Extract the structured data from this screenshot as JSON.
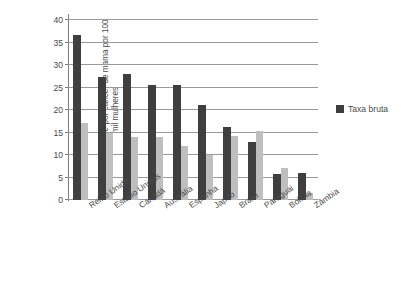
{
  "chart_data": {
    "type": "bar",
    "title": "",
    "xlabel": "",
    "ylabel": "Taxa de mortalidade por câncer de mama por 100 mil mulheres",
    "ylim": [
      0,
      40
    ],
    "ytick_step": 5,
    "ytick_labels": [
      "0",
      "5",
      "10",
      "15",
      "20",
      "25",
      "30",
      "35",
      "40"
    ],
    "grid": true,
    "legend_position": "right",
    "categories": [
      "Reino Unido",
      "Estado Unidos",
      "Canadá",
      "Austrália",
      "Espanha",
      "Japão",
      "Brasil",
      "Paraguai",
      "Bolívia",
      "Zâmbia"
    ],
    "series": [
      {
        "name": "Taxa bruta",
        "color": "#3f3f3f",
        "values": [
          36.7,
          27.4,
          28.0,
          25.5,
          25.5,
          21.1,
          16.2,
          12.8,
          5.8,
          6.0
        ]
      },
      {
        "name": "",
        "color": "#bfbfbf",
        "values": [
          17.2,
          15.0,
          14.0,
          14.0,
          11.9,
          10.0,
          14.2,
          15.4,
          7.2,
          1.5
        ]
      }
    ],
    "legend": [
      {
        "label": "Taxa bruta",
        "color": "#3f3f3f",
        "swatch": "legend-swatch-dark"
      }
    ]
  },
  "colors": {
    "background": "#ffffff",
    "axis": "#7d7d7d",
    "gridline": "#9a9a9a",
    "text": "#4a4a4a",
    "series_dark": "#3f3f3f",
    "series_light": "#bfbfbf"
  }
}
